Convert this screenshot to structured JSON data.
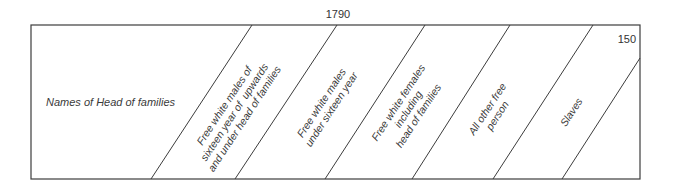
{
  "header": {
    "year": "1790",
    "page_number": "150"
  },
  "table": {
    "first_column_label": "Names of Head of families",
    "diagonal_columns": [
      {
        "label": "Free white males of\nsixteen year of  upwards\nand under head of families"
      },
      {
        "label": "Free white males\nunder sixteen year"
      },
      {
        "label": "Free white females\nincluding\nhead of families"
      },
      {
        "label": "All other free\nperson"
      },
      {
        "label": "Slaves"
      }
    ]
  },
  "colors": {
    "line": "#3c3c3c",
    "text": "#3a3a3a",
    "background": "#ffffff"
  }
}
